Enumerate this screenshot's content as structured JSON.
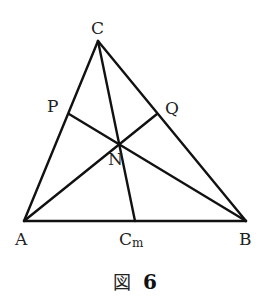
{
  "figure": {
    "caption_prefix": "図",
    "caption_number": "6",
    "stroke_color": "#111111",
    "background": "#ffffff"
  },
  "points": {
    "A": {
      "label": "A",
      "x": 24,
      "y": 221
    },
    "B": {
      "label": "B",
      "x": 246,
      "y": 221
    },
    "C": {
      "label": "C",
      "x": 98,
      "y": 41
    },
    "P": {
      "label": "P",
      "x": 69,
      "y": 114
    },
    "Q": {
      "label": "Q",
      "x": 157,
      "y": 114
    },
    "N": {
      "label": "N",
      "x": 119,
      "y": 143
    },
    "Cm": {
      "label": "C",
      "subscript": "m",
      "x": 135,
      "y": 221
    }
  },
  "segments": [
    [
      "A",
      "B"
    ],
    [
      "B",
      "C"
    ],
    [
      "C",
      "A"
    ],
    [
      "C",
      "Cm"
    ],
    [
      "A",
      "Q"
    ],
    [
      "B",
      "P"
    ]
  ]
}
